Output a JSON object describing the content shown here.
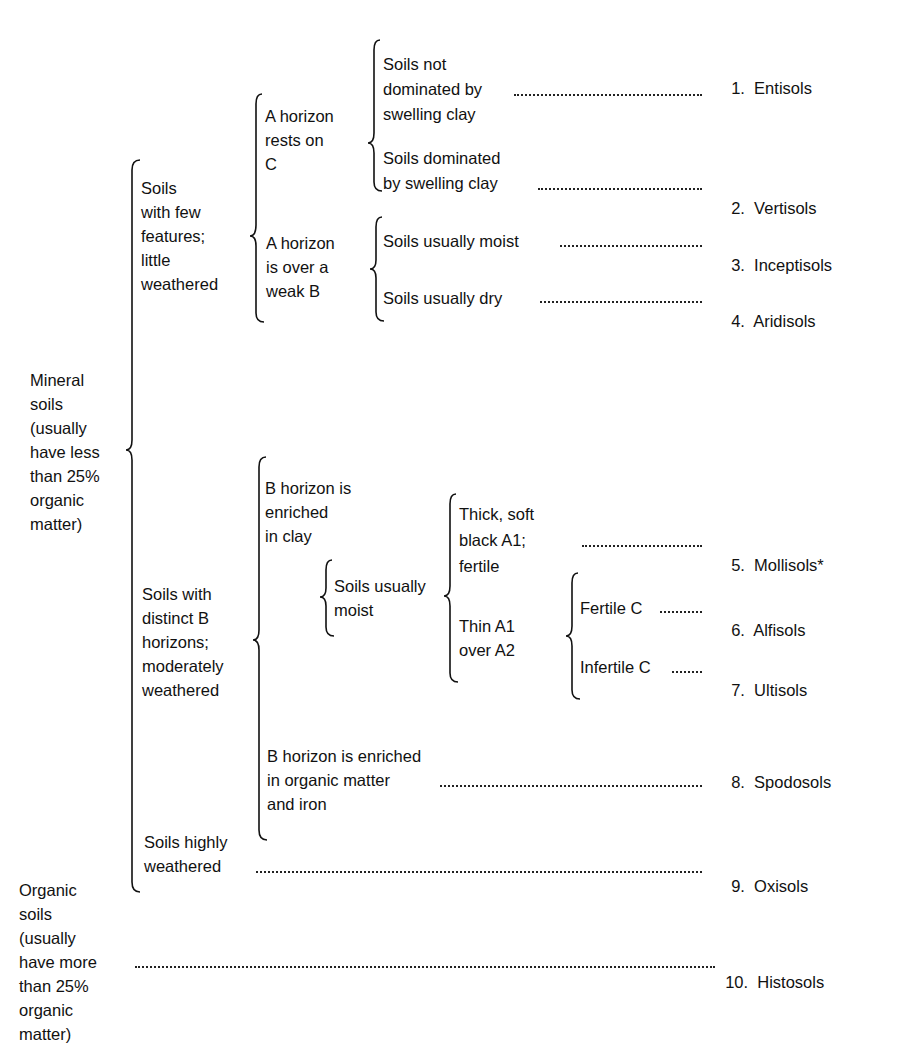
{
  "diagram": {
    "nodes": {
      "mineral": "Mineral\nsoils\n(usually\nhave less\nthan 25%\norganic\nmatter)",
      "organic": "Organic\nsoils\n(usually\nhave more\nthan 25%\norganic\nmatter)",
      "few_features": "Soils\nwith few\nfeatures;\nlittle\nweathered",
      "distinct_b": "Soils with\ndistinct B\nhorizons;\nmoderately\nweathered",
      "highly_weathered_1": "Soils highly",
      "highly_weathered_2": "weathered",
      "a_rests_on_c": "A horizon\nrests on\nC",
      "a_over_weak_b": "A horizon\nis over a\nweak B",
      "not_swelling_1": "Soils not",
      "not_swelling_2": "dominated by",
      "not_swelling_3": "swelling clay",
      "swelling_1": "Soils dominated",
      "swelling_2": "by swelling clay",
      "usually_moist": "Soils usually moist",
      "usually_dry": "Soils usually dry",
      "b_clay": "B horizon is\nenriched\nin clay",
      "b_organic_1": "B horizon is enriched",
      "b_organic_2": "in organic matter",
      "b_organic_3": "and iron",
      "moist_clay": "Soils usually\nmoist",
      "thick_1": "Thick, soft",
      "thick_2": "black A1;",
      "thick_3": "fertile",
      "thin": "Thin A1\nover A2",
      "fertile_c": "Fertile C",
      "infertile_c": "Infertile C"
    },
    "results": [
      {
        "num": "1.",
        "name": "Entisols"
      },
      {
        "num": "2.",
        "name": "Vertisols"
      },
      {
        "num": "3.",
        "name": "Inceptisols"
      },
      {
        "num": "4.",
        "name": "Aridisols"
      },
      {
        "num": "5.",
        "name": "Mollisols*"
      },
      {
        "num": "6.",
        "name": "Alfisols"
      },
      {
        "num": "7.",
        "name": "Ultisols"
      },
      {
        "num": "8.",
        "name": "Spodosols"
      },
      {
        "num": "9.",
        "name": "Oxisols"
      },
      {
        "num": "10.",
        "name": "Histosols"
      }
    ]
  }
}
